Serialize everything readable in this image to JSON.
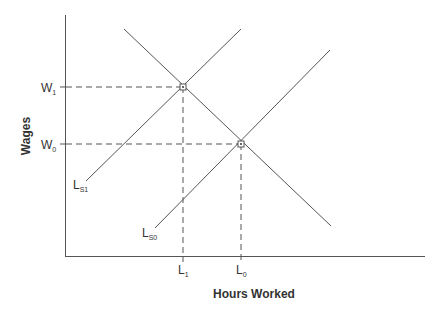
{
  "diagram": {
    "x_axis_label": "Hours Worked",
    "y_axis_label": "Wages",
    "y_ticks": [
      {
        "main": "W",
        "sub": "1"
      },
      {
        "main": "W",
        "sub": "0"
      }
    ],
    "x_ticks": [
      {
        "main": "L",
        "sub": "1"
      },
      {
        "main": "L",
        "sub": "0"
      }
    ],
    "curves": [
      {
        "name": "Demand",
        "label_main": "",
        "label_sub": ""
      },
      {
        "name": "Supply 1",
        "label_main": "L",
        "label_sub": "S1"
      },
      {
        "name": "Supply 0",
        "label_main": "L",
        "label_sub": "S0"
      }
    ],
    "equilibria": [
      {
        "wage": "W1",
        "hours": "L1"
      },
      {
        "wage": "W0",
        "hours": "L0"
      }
    ],
    "colors": {
      "line": "#555555",
      "text": "#333333",
      "dashed": "#555555"
    }
  }
}
